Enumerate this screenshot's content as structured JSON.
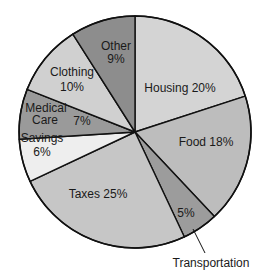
{
  "chart_data": {
    "type": "pie",
    "title": "",
    "start_angle_deg": 0,
    "direction": "clockwise",
    "slices": [
      {
        "label": "Housing",
        "value": 20,
        "text": [
          "Housing 20%"
        ],
        "color": "#d4d4d4"
      },
      {
        "label": "Food",
        "value": 18,
        "text": [
          "Food 18%"
        ],
        "color": "#bdbdbd"
      },
      {
        "label": "Transportation",
        "value": 5,
        "text": [
          "5%"
        ],
        "color": "#9c9c9c",
        "callout": "Transportation"
      },
      {
        "label": "Taxes",
        "value": 25,
        "text": [
          "Taxes 25%"
        ],
        "color": "#c6c6c6"
      },
      {
        "label": "Savings",
        "value": 6,
        "text": [
          "Savings",
          "6%"
        ],
        "color": "#eeeeee"
      },
      {
        "label": "Medical Care",
        "value": 7,
        "text": [
          "Medical",
          "Care",
          "7%"
        ],
        "color": "#9a9a9a"
      },
      {
        "label": "Clothing",
        "value": 10,
        "text": [
          "Clothing",
          "10%"
        ],
        "color": "#d0d0d0"
      },
      {
        "label": "Other",
        "value": 9,
        "text": [
          "Other",
          "9%"
        ],
        "color": "#8d8d8d"
      }
    ]
  }
}
